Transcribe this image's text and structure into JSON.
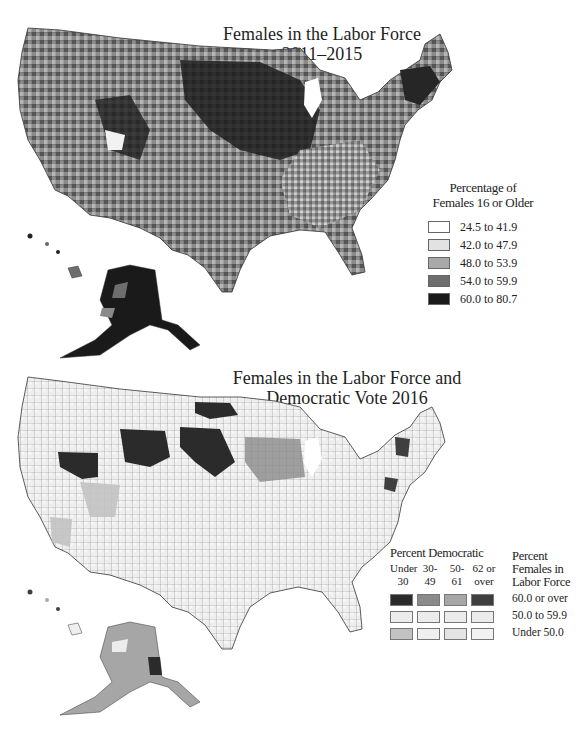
{
  "map1": {
    "title_line1": "Females in the Labor Force",
    "title_line2": "2011–2015",
    "legend": {
      "title_line1": "Percentage of",
      "title_line2": "Females 16 or Older",
      "classes": [
        {
          "label": "24.5 to 41.9",
          "color": "#ffffff"
        },
        {
          "label": "42.0 to 47.9",
          "color": "#e2e2e2"
        },
        {
          "label": "48.0 to 53.9",
          "color": "#a9a9a9"
        },
        {
          "label": "54.0 to 59.9",
          "color": "#6e6e6e"
        },
        {
          "label": "60.0 to 80.7",
          "color": "#1a1a1a"
        }
      ]
    }
  },
  "map2": {
    "title_line1": "Females in the Labor Force and",
    "title_line2": "Democratic Vote 2016",
    "legend": {
      "democratic_title": "Percent Democratic",
      "democratic_columns": [
        {
          "line1": "Under",
          "line2": "30"
        },
        {
          "line1": "30-",
          "line2": "49"
        },
        {
          "line1": "50-",
          "line2": "61"
        },
        {
          "line1": "62 or",
          "line2": "over"
        }
      ],
      "labor_title_line1": "Percent",
      "labor_title_line2": "Females in",
      "labor_title_line3": "Labor Force",
      "rows": [
        {
          "label": "60.0 or over",
          "colors": [
            "#2b2b2b",
            "#8a8a8a",
            "#a6a6a6",
            "#3f3f3f"
          ]
        },
        {
          "label": "50.0 to 59.9",
          "colors": [
            "#ececec",
            "#ececec",
            "#ececec",
            "#ececec"
          ]
        },
        {
          "label": "Under 50.0",
          "colors": [
            "#c2c2c2",
            "#efefef",
            "#e3e3e3",
            "#f2f2f2"
          ]
        }
      ]
    }
  }
}
